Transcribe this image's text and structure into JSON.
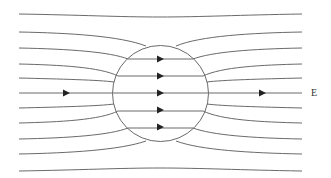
{
  "diagram": {
    "field_label": "E",
    "colors": {
      "line": "#6a6a6a",
      "arrow": "#222222",
      "text": "#333333"
    },
    "sphere": {
      "cx": 160.5,
      "cy": 93.5,
      "r": 48
    },
    "field_lines": [
      {
        "d": "M19,14 C80,15 120,17 160,17 C200,17 240,15 302,14"
      },
      {
        "d": "M19,32 C70,33 120,36 146,46"
      },
      {
        "d": "M176,46 C200,36 250,33 302,32"
      },
      {
        "d": "M19,48 C70,49 110,52 128,59"
      },
      {
        "d": "M193,59 C212,52 250,49 302,48"
      },
      {
        "d": "M19,64 C60,65 100,67 118,76"
      },
      {
        "d": "M203,76 C222,67 260,65 302,64"
      },
      {
        "d": "M19,78 C60,79 100,80 114,82"
      },
      {
        "d": "M207,82 C222,80 260,79 302,78"
      },
      {
        "d": "M19,93 L302,93"
      },
      {
        "d": "M19,108 C60,107 100,106 114,104"
      },
      {
        "d": "M207,104 C222,106 260,107 302,108"
      },
      {
        "d": "M19,123 C60,122 100,120 118,111"
      },
      {
        "d": "M203,111 C222,120 260,122 302,123"
      },
      {
        "d": "M19,139 C70,138 110,135 128,128"
      },
      {
        "d": "M193,128 C212,135 250,138 302,139"
      },
      {
        "d": "M19,154 C70,153 120,150 146,141"
      },
      {
        "d": "M176,141 C200,150 250,153 302,154"
      },
      {
        "d": "M19,171 C80,170 120,168 160,168 C200,168 240,170 302,171"
      }
    ],
    "inner_lines": [
      {
        "d": "M128,59 L193,59"
      },
      {
        "d": "M118,76 L203,76"
      },
      {
        "d": "M118,111 L203,111"
      },
      {
        "d": "M128,128 L193,128"
      }
    ],
    "arrows": [
      {
        "x": 69,
        "y": 93
      },
      {
        "x": 163,
        "y": 59
      },
      {
        "x": 163,
        "y": 76
      },
      {
        "x": 163,
        "y": 93
      },
      {
        "x": 163,
        "y": 110
      },
      {
        "x": 163,
        "y": 127
      },
      {
        "x": 265,
        "y": 93
      }
    ]
  }
}
